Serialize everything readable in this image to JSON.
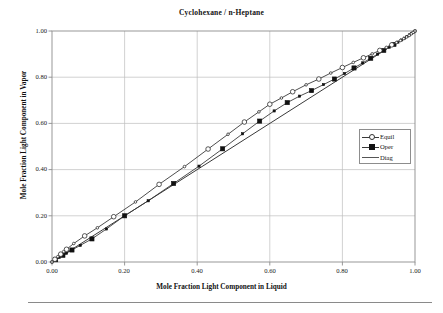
{
  "chart_data": {
    "type": "line",
    "title": "Cyclohexane / n-Heptane",
    "xlabel": "Mole Fraction Light Component in Liquid",
    "ylabel": "Mole Fraction Light Component in Vapor",
    "xlim": [
      0.0,
      1.0
    ],
    "ylim": [
      0.0,
      1.0
    ],
    "xticks": [
      "0.00",
      "0.20",
      "0.40",
      "0.60",
      "0.80",
      "1.00"
    ],
    "yticks": [
      "0.00",
      "0.20",
      "0.40",
      "0.60",
      "0.80",
      "1.00"
    ],
    "xtick_values": [
      0.0,
      0.2,
      0.4,
      0.6,
      0.8,
      1.0
    ],
    "ytick_values": [
      0.0,
      0.2,
      0.4,
      0.6,
      0.8,
      1.0
    ],
    "grid": true,
    "legend_position": "right-middle",
    "series": [
      {
        "name": "Equil",
        "marker": "open-circle",
        "x": [
          0.0,
          0.008,
          0.016,
          0.024,
          0.032,
          0.04,
          0.06,
          0.09,
          0.125,
          0.17,
          0.23,
          0.295,
          0.365,
          0.43,
          0.485,
          0.53,
          0.57,
          0.6,
          0.632,
          0.663,
          0.7,
          0.735,
          0.768,
          0.8,
          0.83,
          0.858,
          0.882,
          0.903,
          0.921,
          0.936,
          0.949,
          0.96,
          0.969,
          0.977,
          0.984,
          0.99,
          0.995,
          1.0
        ],
        "y": [
          0.0,
          0.012,
          0.023,
          0.034,
          0.045,
          0.055,
          0.08,
          0.113,
          0.148,
          0.196,
          0.26,
          0.336,
          0.413,
          0.489,
          0.553,
          0.606,
          0.65,
          0.683,
          0.71,
          0.737,
          0.767,
          0.792,
          0.818,
          0.842,
          0.864,
          0.884,
          0.901,
          0.916,
          0.929,
          0.94,
          0.95,
          0.959,
          0.967,
          0.974,
          0.981,
          0.988,
          0.994,
          1.0
        ]
      },
      {
        "name": "Oper",
        "marker": "filled-square",
        "x": [
          0.0,
          0.01,
          0.02,
          0.03,
          0.04,
          0.055,
          0.078,
          0.11,
          0.15,
          0.2,
          0.265,
          0.335,
          0.405,
          0.47,
          0.525,
          0.572,
          0.612,
          0.648,
          0.682,
          0.715,
          0.748,
          0.778,
          0.806,
          0.832,
          0.856,
          0.878,
          0.897,
          0.914,
          0.929,
          0.942,
          0.953,
          0.963,
          0.971,
          0.978,
          0.985,
          0.99,
          0.995,
          1.0
        ],
        "y": [
          0.0,
          0.01,
          0.02,
          0.029,
          0.038,
          0.052,
          0.072,
          0.1,
          0.143,
          0.2,
          0.265,
          0.34,
          0.415,
          0.49,
          0.555,
          0.61,
          0.654,
          0.69,
          0.718,
          0.742,
          0.768,
          0.792,
          0.816,
          0.84,
          0.862,
          0.882,
          0.9,
          0.916,
          0.93,
          0.942,
          0.952,
          0.961,
          0.969,
          0.976,
          0.983,
          0.989,
          0.994,
          1.0
        ]
      },
      {
        "name": "Diag",
        "marker": "none",
        "x": [
          0.0,
          1.0
        ],
        "y": [
          0.0,
          1.0
        ]
      }
    ]
  },
  "legend": {
    "items": [
      {
        "label": "Equil",
        "marker": "open-circle"
      },
      {
        "label": "Oper",
        "marker": "filled-square"
      },
      {
        "label": "Diag",
        "marker": "none"
      }
    ]
  },
  "colors": {
    "line": "#3a3a3a",
    "marker_fill_open": "#ffffff",
    "marker_fill_solid": "#111111",
    "grid": "#bfbfbf",
    "axis": "#8d8d8d",
    "text": "#111111"
  }
}
